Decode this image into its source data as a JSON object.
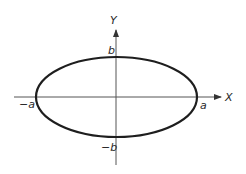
{
  "diagram": {
    "type": "ellipse-on-axes",
    "colors": {
      "background": "#ffffff",
      "ellipse": "#1e1e1e",
      "axis": "#555555",
      "text": "#2a2a2a"
    },
    "axes": {
      "x_label": "X",
      "y_label": "Y"
    },
    "intercepts": {
      "pos_x": "a",
      "neg_x": "−a",
      "pos_y": "b",
      "neg_y": "−b"
    }
  }
}
